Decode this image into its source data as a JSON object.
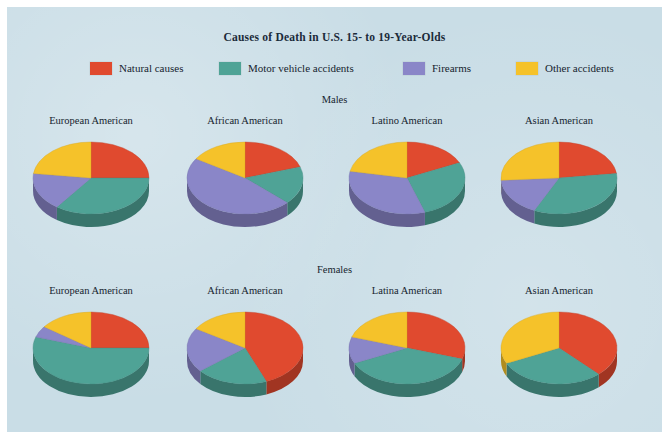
{
  "chart_data": {
    "type": "pie",
    "title": "Causes of Death in U.S. 15- to 19-Year-Olds",
    "xlabel": "",
    "ylabel": "",
    "legend_position": "top",
    "grid": false,
    "categories": [
      "Natural causes",
      "Motor vehicle accidents",
      "Firearms",
      "Other accidents"
    ],
    "colors": [
      "#e04a2f",
      "#4fa396",
      "#8a86c8",
      "#f5c22a"
    ],
    "groups": [
      {
        "name": "Males",
        "charts": [
          {
            "label": "European American",
            "values": [
              25,
              35,
              17,
              23
            ]
          },
          {
            "label": "African American",
            "values": [
              20,
              17,
              47,
              16
            ]
          },
          {
            "label": "Latino American",
            "values": [
              18,
              27,
              33,
              22
            ]
          },
          {
            "label": "Asian American",
            "values": [
              23,
              34,
              17,
              26
            ]
          }
        ]
      },
      {
        "name": "Females",
        "charts": [
          {
            "label": "European American",
            "values": [
              25,
              55,
              5,
              15
            ]
          },
          {
            "label": "African American",
            "values": [
              44,
              20,
              20,
              16
            ]
          },
          {
            "label": "Latina American",
            "values": [
              30,
              38,
              12,
              20
            ]
          },
          {
            "label": "Asian American",
            "values": [
              38,
              30,
              0,
              32
            ]
          }
        ]
      }
    ]
  },
  "figure": {
    "title": "Causes of Death in U.S. 15- to 19-Year-Olds",
    "background_color": "#c9dde6"
  },
  "legend": {
    "items": [
      {
        "label": "Natural causes",
        "color": "#e04a2f"
      },
      {
        "label": "Motor vehicle accidents",
        "color": "#4fa396"
      },
      {
        "label": "Firearms",
        "color": "#8a86c8"
      },
      {
        "label": "Other accidents",
        "color": "#f5c22a"
      }
    ]
  },
  "groups": {
    "males_label": "Males",
    "females_label": "Females"
  }
}
